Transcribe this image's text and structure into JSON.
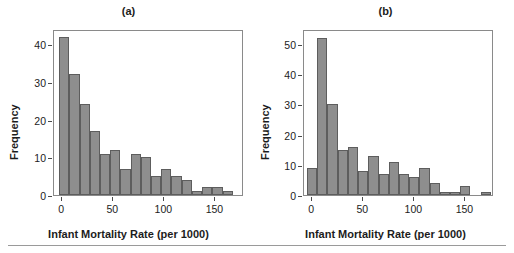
{
  "figure": {
    "bottom_rule": true
  },
  "chart_data": [
    {
      "type": "bar",
      "panel": "(a)",
      "title": "(a)",
      "xlabel": "Infant Mortality Rate (per 1000)",
      "ylabel": "Frequency",
      "xlim": [
        -8,
        178
      ],
      "ylim": [
        0,
        44
      ],
      "xticks": [
        0,
        50,
        100,
        150
      ],
      "xtick_labels": [
        "0",
        "50",
        "100",
        "150"
      ],
      "yticks": [
        0,
        10,
        20,
        30,
        40
      ],
      "ytick_labels": [
        "0",
        "10",
        "20",
        "30",
        "40"
      ],
      "grid": false,
      "legend": "none",
      "bin_width": 10,
      "bin_starts": [
        -3,
        7,
        17,
        27,
        37,
        47,
        57,
        67,
        77,
        87,
        97,
        107,
        117,
        127,
        137,
        147,
        157,
        167
      ],
      "categories": [
        "-3",
        "7",
        "17",
        "27",
        "37",
        "47",
        "57",
        "67",
        "77",
        "87",
        "97",
        "107",
        "117",
        "127",
        "137",
        "147",
        "157",
        "167"
      ],
      "values": [
        42,
        32,
        24,
        17,
        11,
        12,
        7,
        11,
        10,
        5,
        7,
        5,
        4,
        1,
        2,
        2,
        1,
        0
      ],
      "bar_color": "#8e8e8e",
      "bar_edge_color": "#5d5d5d"
    },
    {
      "type": "bar",
      "panel": "(b)",
      "title": "(b)",
      "xlabel": "Infant Mortality Rate (per 1000)",
      "ylabel": "Frequency",
      "xlim": [
        -8,
        178
      ],
      "ylim": [
        0,
        55
      ],
      "xticks": [
        0,
        50,
        100,
        150
      ],
      "xtick_labels": [
        "0",
        "50",
        "100",
        "150"
      ],
      "yticks": [
        0,
        10,
        20,
        30,
        40,
        50
      ],
      "ytick_labels": [
        "0",
        "10",
        "20",
        "30",
        "40",
        "50"
      ],
      "grid": false,
      "legend": "none",
      "bin_width": 10,
      "bin_starts": [
        -5,
        5,
        15,
        25,
        35,
        45,
        55,
        65,
        75,
        85,
        95,
        105,
        115,
        125,
        135,
        145,
        155,
        165
      ],
      "categories": [
        "-5",
        "5",
        "15",
        "25",
        "35",
        "45",
        "55",
        "65",
        "75",
        "85",
        "95",
        "105",
        "115",
        "125",
        "135",
        "145",
        "155",
        "165"
      ],
      "values": [
        9,
        52,
        30,
        15,
        16,
        8,
        13,
        7,
        11,
        7,
        6,
        9,
        4,
        1,
        1,
        3,
        0,
        1
      ],
      "bar_color": "#8e8e8e",
      "bar_edge_color": "#5d5d5d"
    }
  ]
}
